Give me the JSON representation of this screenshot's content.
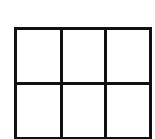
{
  "diagram": {
    "type": "grid",
    "rows": 2,
    "columns": 3,
    "cells": [
      [
        "",
        "",
        ""
      ],
      [
        "",
        "",
        ""
      ]
    ],
    "line_color": "#111111",
    "background": "#ffffff"
  }
}
